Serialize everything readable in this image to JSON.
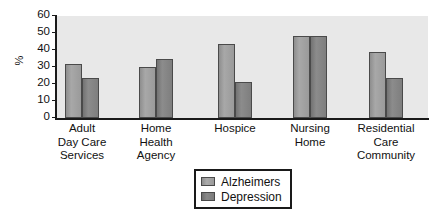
{
  "chart_data": {
    "type": "bar",
    "title": "",
    "xlabel": "",
    "ylabel": "%",
    "ylim": [
      0,
      60
    ],
    "yticks": [
      0,
      10,
      20,
      30,
      40,
      50,
      60
    ],
    "grid": false,
    "legend_position": "bottom-center",
    "categories": [
      "Adult\nDay Care\nServices",
      "Home\nHealth\nAgency",
      "Hospice",
      "Nursing\nHome",
      "Residential\nCare\nCommunity"
    ],
    "series": [
      {
        "name": "Alzheimers",
        "color": "#a0a0a0",
        "values": [
          32,
          30,
          43.5,
          48,
          39
        ]
      },
      {
        "name": "Depression",
        "color": "#808080",
        "values": [
          23.5,
          34.5,
          21,
          48,
          23.5
        ]
      }
    ]
  },
  "axis": {
    "y_title": "%",
    "y_tick_labels": [
      "60",
      "50",
      "40",
      "30",
      "20",
      "10",
      "0"
    ]
  },
  "categories_display": [
    {
      "line1": "Adult",
      "line2": "Day Care",
      "line3": "Services"
    },
    {
      "line1": "Home",
      "line2": "Health",
      "line3": "Agency"
    },
    {
      "line1": "Hospice",
      "line2": "",
      "line3": ""
    },
    {
      "line1": "Nursing",
      "line2": "Home",
      "line3": ""
    },
    {
      "line1": "Residential",
      "line2": "Care",
      "line3": "Community"
    }
  ],
  "legend": {
    "items": [
      {
        "label": "Alzheimers"
      },
      {
        "label": "Depression"
      }
    ]
  }
}
